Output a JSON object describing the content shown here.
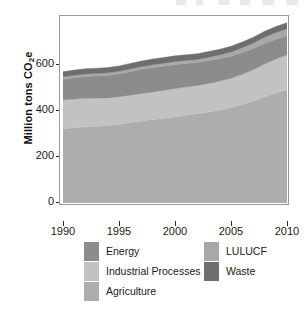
{
  "figure": {
    "background": "#ffffff",
    "panel_border": "#9a9a9a"
  },
  "axis": {
    "y_title_main": "Million tons CO",
    "y_title_sub": "2",
    "y_title_tail": "e",
    "y_ticks": [
      "0",
      "200",
      "400",
      "600"
    ],
    "x_ticks": [
      "1990",
      "1995",
      "2000",
      "2005",
      "2010"
    ]
  },
  "legend": {
    "left_column": [
      {
        "label": "Energy",
        "color": "#8c8c8c"
      },
      {
        "label": "Industrial Processes",
        "color": "#c2c2c2"
      },
      {
        "label": "Agriculture",
        "color": "#adadad"
      }
    ],
    "right_column": [
      {
        "label": "LULUCF",
        "color": "#a8a8a8"
      },
      {
        "label": "Waste",
        "color": "#6e6e6e"
      }
    ]
  },
  "chart_data": {
    "type": "area",
    "stacked": true,
    "title": "",
    "xlabel": "",
    "ylabel": "Million tons CO2e",
    "xlim": [
      1990,
      2010
    ],
    "ylim": [
      0,
      800
    ],
    "grid": false,
    "legend_position": "bottom",
    "x": [
      1990,
      1991,
      1992,
      1993,
      1994,
      1995,
      1996,
      1997,
      1998,
      1999,
      2000,
      2001,
      2002,
      2003,
      2004,
      2005,
      2006,
      2007,
      2008,
      2009,
      2010
    ],
    "series": [
      {
        "name": "Agriculture",
        "color": "#adadad",
        "values": [
          322,
          327,
          331,
          334,
          336,
          342,
          350,
          356,
          362,
          368,
          374,
          381,
          388,
          396,
          404,
          414,
          428,
          444,
          462,
          478,
          492
        ]
      },
      {
        "name": "Industrial Processes",
        "color": "#c2c2c2",
        "values": [
          127,
          125,
          124,
          122,
          121,
          120,
          119,
          120,
          121,
          122,
          124,
          124,
          123,
          124,
          126,
          128,
          132,
          136,
          142,
          148,
          153
        ]
      },
      {
        "name": "Energy",
        "color": "#8c8c8c",
        "values": [
          90,
          93,
          95,
          96,
          98,
          100,
          102,
          105,
          106,
          105,
          104,
          102,
          100,
          100,
          98,
          96,
          94,
          92,
          90,
          86,
          82
        ]
      },
      {
        "name": "LULUCF",
        "color": "#a8a8a8",
        "values": [
          10,
          10,
          11,
          11,
          11,
          11,
          12,
          12,
          12,
          13,
          13,
          13,
          13,
          14,
          16,
          18,
          21,
          24,
          27,
          29,
          31
        ]
      },
      {
        "name": "Waste",
        "color": "#6e6e6e",
        "values": [
          22,
          23,
          23,
          23,
          23,
          23,
          24,
          24,
          25,
          25,
          25,
          25,
          25,
          25,
          25,
          25,
          25,
          25,
          26,
          26,
          26
        ]
      }
    ],
    "totals": [
      571,
      578,
      584,
      586,
      589,
      596,
      607,
      617,
      626,
      633,
      640,
      645,
      649,
      659,
      669,
      681,
      700,
      721,
      747,
      767,
      784
    ]
  }
}
